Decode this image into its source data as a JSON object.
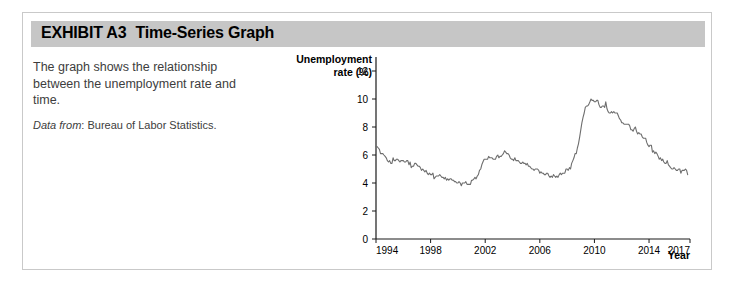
{
  "exhibit": {
    "label": "EXHIBIT A3",
    "title": "Time-Series Graph"
  },
  "description": {
    "body": "The graph shows the relationship between the unemployment rate and time.",
    "source_prefix": "Data from",
    "source_separator": ":",
    "source_value": "Bureau of Labor Statistics."
  },
  "colors": {
    "header_bar": "#c6c6c6",
    "card_border": "#c9c9c9",
    "line": "#6e6e6e",
    "axis": "#1a1a1a",
    "text": "#3d3d3d"
  },
  "chart_data": {
    "type": "line",
    "title": "",
    "ylabel": "Unemployment rate (%)",
    "ylabel_line1": "Unemployment",
    "ylabel_line2": "rate (%)",
    "xlabel": "Year",
    "xlim": [
      1994,
      2017
    ],
    "ylim": [
      0,
      13
    ],
    "ytick_values": [
      0,
      2,
      4,
      6,
      8,
      10,
      12
    ],
    "ytick_labels": [
      "0",
      "2",
      "4",
      "6",
      "8",
      "10",
      "12"
    ],
    "xtick_values": [
      1994,
      1998,
      2002,
      2006,
      2010,
      2014,
      2017
    ],
    "xtick_labels": [
      "1994",
      "1998",
      "2002",
      "2006",
      "2010",
      "2014",
      "2017"
    ],
    "grid": false,
    "legend": "none",
    "series": [
      {
        "name": "Unemployment rate",
        "x": [
          1994.0,
          1994.08,
          1994.17,
          1994.25,
          1994.33,
          1994.42,
          1994.5,
          1994.58,
          1994.67,
          1994.75,
          1994.83,
          1994.92,
          1995.0,
          1995.08,
          1995.17,
          1995.25,
          1995.33,
          1995.42,
          1995.5,
          1995.58,
          1995.67,
          1995.75,
          1995.83,
          1995.92,
          1996.0,
          1996.08,
          1996.17,
          1996.25,
          1996.33,
          1996.42,
          1996.5,
          1996.58,
          1996.67,
          1996.75,
          1996.83,
          1996.92,
          1997.0,
          1997.08,
          1997.17,
          1997.25,
          1997.33,
          1997.42,
          1997.5,
          1997.58,
          1997.67,
          1997.75,
          1997.83,
          1997.92,
          1998.0,
          1998.08,
          1998.17,
          1998.25,
          1998.33,
          1998.42,
          1998.5,
          1998.58,
          1998.67,
          1998.75,
          1998.83,
          1998.92,
          1999.0,
          1999.08,
          1999.17,
          1999.25,
          1999.33,
          1999.42,
          1999.5,
          1999.58,
          1999.67,
          1999.75,
          1999.83,
          1999.92,
          2000.0,
          2000.08,
          2000.17,
          2000.25,
          2000.33,
          2000.42,
          2000.5,
          2000.58,
          2000.67,
          2000.75,
          2000.83,
          2000.92,
          2001.0,
          2001.08,
          2001.17,
          2001.25,
          2001.33,
          2001.42,
          2001.5,
          2001.58,
          2001.67,
          2001.75,
          2001.83,
          2001.92,
          2002.0,
          2002.08,
          2002.17,
          2002.25,
          2002.33,
          2002.42,
          2002.5,
          2002.58,
          2002.67,
          2002.75,
          2002.83,
          2002.92,
          2003.0,
          2003.08,
          2003.17,
          2003.25,
          2003.33,
          2003.42,
          2003.5,
          2003.58,
          2003.67,
          2003.75,
          2003.83,
          2003.92,
          2004.0,
          2004.08,
          2004.17,
          2004.25,
          2004.33,
          2004.42,
          2004.5,
          2004.58,
          2004.67,
          2004.75,
          2004.83,
          2004.92,
          2005.0,
          2005.08,
          2005.17,
          2005.25,
          2005.33,
          2005.42,
          2005.5,
          2005.58,
          2005.67,
          2005.75,
          2005.83,
          2005.92,
          2006.0,
          2006.08,
          2006.17,
          2006.25,
          2006.33,
          2006.42,
          2006.5,
          2006.58,
          2006.67,
          2006.75,
          2006.83,
          2006.92,
          2007.0,
          2007.08,
          2007.17,
          2007.25,
          2007.33,
          2007.42,
          2007.5,
          2007.58,
          2007.67,
          2007.75,
          2007.83,
          2007.92,
          2008.0,
          2008.08,
          2008.17,
          2008.25,
          2008.33,
          2008.42,
          2008.5,
          2008.58,
          2008.67,
          2008.75,
          2008.83,
          2008.92,
          2009.0,
          2009.08,
          2009.17,
          2009.25,
          2009.33,
          2009.42,
          2009.5,
          2009.58,
          2009.67,
          2009.75,
          2009.83,
          2009.92,
          2010.0,
          2010.08,
          2010.17,
          2010.25,
          2010.33,
          2010.42,
          2010.5,
          2010.58,
          2010.67,
          2010.75,
          2010.83,
          2010.92,
          2011.0,
          2011.08,
          2011.17,
          2011.25,
          2011.33,
          2011.42,
          2011.5,
          2011.58,
          2011.67,
          2011.75,
          2011.83,
          2011.92,
          2012.0,
          2012.08,
          2012.17,
          2012.25,
          2012.33,
          2012.42,
          2012.5,
          2012.58,
          2012.67,
          2012.75,
          2012.83,
          2012.92,
          2013.0,
          2013.08,
          2013.17,
          2013.25,
          2013.33,
          2013.42,
          2013.5,
          2013.58,
          2013.67,
          2013.75,
          2013.83,
          2013.92,
          2014.0,
          2014.08,
          2014.17,
          2014.25,
          2014.33,
          2014.42,
          2014.5,
          2014.58,
          2014.67,
          2014.75,
          2014.83,
          2014.92,
          2015.0,
          2015.08,
          2015.17,
          2015.25,
          2015.33,
          2015.42,
          2015.5,
          2015.58,
          2015.67,
          2015.75,
          2015.83,
          2015.92,
          2016.0,
          2016.08,
          2016.17,
          2016.25,
          2016.33,
          2016.42,
          2016.5,
          2016.58,
          2016.67,
          2016.75,
          2016.83
        ],
        "values": [
          6.6,
          6.6,
          6.5,
          6.4,
          6.1,
          6.1,
          6.1,
          6.0,
          5.9,
          5.8,
          5.6,
          5.5,
          5.6,
          5.4,
          5.4,
          5.8,
          5.6,
          5.6,
          5.7,
          5.7,
          5.6,
          5.5,
          5.6,
          5.6,
          5.6,
          5.5,
          5.5,
          5.6,
          5.6,
          5.3,
          5.5,
          5.1,
          5.2,
          5.2,
          5.4,
          5.4,
          5.3,
          5.2,
          5.2,
          5.1,
          4.9,
          5.0,
          4.9,
          4.8,
          4.9,
          4.7,
          4.6,
          4.7,
          4.6,
          4.6,
          4.7,
          4.3,
          4.4,
          4.5,
          4.5,
          4.5,
          4.6,
          4.5,
          4.4,
          4.4,
          4.3,
          4.4,
          4.2,
          4.3,
          4.2,
          4.3,
          4.3,
          4.2,
          4.2,
          4.1,
          4.1,
          4.0,
          4.0,
          4.1,
          4.0,
          3.8,
          4.0,
          4.0,
          4.0,
          4.1,
          3.9,
          3.9,
          3.9,
          3.9,
          4.2,
          4.2,
          4.3,
          4.4,
          4.3,
          4.5,
          4.6,
          4.9,
          5.0,
          5.3,
          5.5,
          5.7,
          5.7,
          5.7,
          5.7,
          5.9,
          5.8,
          5.8,
          5.8,
          5.7,
          5.7,
          5.7,
          5.9,
          6.0,
          5.8,
          5.9,
          5.9,
          6.0,
          6.1,
          6.3,
          6.2,
          6.1,
          6.1,
          6.0,
          5.8,
          5.7,
          5.7,
          5.6,
          5.8,
          5.6,
          5.6,
          5.6,
          5.5,
          5.4,
          5.4,
          5.5,
          5.4,
          5.4,
          5.3,
          5.4,
          5.2,
          5.2,
          5.1,
          5.0,
          5.0,
          4.9,
          5.0,
          5.0,
          5.0,
          4.9,
          4.7,
          4.8,
          4.7,
          4.7,
          4.6,
          4.6,
          4.7,
          4.7,
          4.5,
          4.4,
          4.5,
          4.4,
          4.6,
          4.5,
          4.4,
          4.5,
          4.4,
          4.6,
          4.7,
          4.6,
          4.7,
          4.7,
          4.7,
          5.0,
          5.0,
          4.9,
          5.1,
          5.0,
          5.4,
          5.6,
          5.8,
          6.1,
          6.1,
          6.5,
          6.8,
          7.3,
          7.8,
          8.3,
          8.7,
          9.0,
          9.4,
          9.5,
          9.5,
          9.6,
          9.8,
          10.0,
          9.9,
          9.9,
          9.8,
          9.8,
          9.9,
          9.9,
          9.6,
          9.4,
          9.4,
          9.5,
          9.5,
          9.4,
          9.8,
          9.3,
          9.1,
          9.0,
          9.0,
          9.1,
          9.0,
          9.1,
          9.0,
          9.0,
          9.0,
          8.8,
          8.6,
          8.5,
          8.3,
          8.3,
          8.2,
          8.2,
          8.2,
          8.2,
          8.2,
          8.1,
          7.8,
          7.8,
          7.7,
          7.9,
          8.0,
          7.7,
          7.5,
          7.6,
          7.5,
          7.5,
          7.3,
          7.2,
          7.2,
          7.2,
          6.9,
          6.7,
          6.6,
          6.7,
          6.7,
          6.2,
          6.3,
          6.1,
          6.2,
          6.1,
          5.9,
          5.7,
          5.8,
          5.6,
          5.7,
          5.5,
          5.4,
          5.4,
          5.6,
          5.3,
          5.2,
          5.1,
          5.0,
          5.0,
          5.1,
          5.0,
          4.9,
          4.9,
          5.0,
          5.0,
          4.7,
          4.9,
          4.9,
          4.9,
          5.0,
          4.9,
          4.6
        ]
      }
    ]
  }
}
